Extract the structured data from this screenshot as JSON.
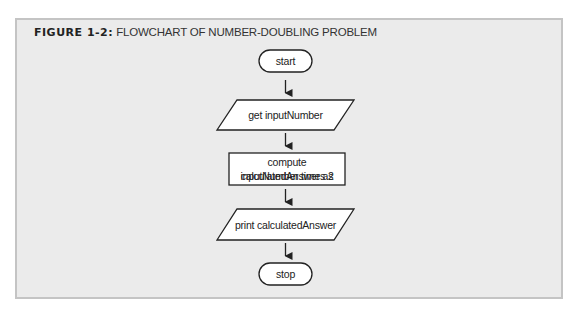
{
  "figure": {
    "label": "FIGURE 1-2:",
    "title": "FLOWCHART OF NUMBER-DOUBLING PROBLEM"
  },
  "flowchart": {
    "nodes": [
      {
        "id": "start",
        "shape": "terminal",
        "text": "start"
      },
      {
        "id": "input",
        "shape": "parallelogram",
        "text": "get inputNumber"
      },
      {
        "id": "process",
        "shape": "rectangle",
        "text_line1": "compute calculatedAnswer as",
        "text_line2": "inputNumber times 2"
      },
      {
        "id": "output",
        "shape": "parallelogram",
        "text": "print calculatedAnswer"
      },
      {
        "id": "stop",
        "shape": "terminal",
        "text": "stop"
      }
    ],
    "edges": [
      {
        "from": "start",
        "to": "input"
      },
      {
        "from": "input",
        "to": "process"
      },
      {
        "from": "process",
        "to": "output"
      },
      {
        "from": "output",
        "to": "stop"
      }
    ]
  },
  "colors": {
    "panel_bg": "#ebebeb",
    "panel_border": "#c4c4c4",
    "shape_fill": "#ffffff",
    "stroke": "#222222"
  }
}
